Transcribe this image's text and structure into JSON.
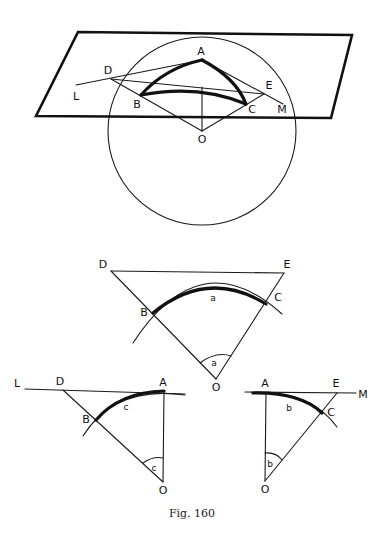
{
  "caption": "Fig. 160",
  "figure_3d": {
    "labels": {
      "A": "A",
      "B": "B",
      "C": "C",
      "D": "D",
      "E": "E",
      "L": "L",
      "M": "M",
      "O": "O"
    }
  },
  "figure_side_a": {
    "labels": {
      "D": "D",
      "E": "E",
      "B": "B",
      "C": "C",
      "O": "O",
      "arc": "a",
      "angle": "a"
    }
  },
  "figure_side_c": {
    "labels": {
      "L": "L",
      "D": "D",
      "A": "A",
      "B": "B",
      "O": "O",
      "arc": "c",
      "angle": "c"
    }
  },
  "figure_side_b": {
    "labels": {
      "A": "A",
      "E": "E",
      "M": "M",
      "C": "C",
      "O": "O",
      "arc": "b",
      "angle": "b"
    }
  }
}
